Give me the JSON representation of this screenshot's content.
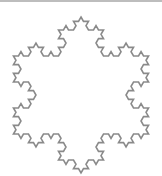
{
  "figure": {
    "type": "koch-snowflake",
    "iterations": 3,
    "center": [
      81,
      95
    ],
    "radius": 78,
    "stroke_color": "#8a8a8a",
    "stroke_width": 1.6,
    "fill_color": "#ffffff",
    "border_color": "#bdbdbd"
  }
}
